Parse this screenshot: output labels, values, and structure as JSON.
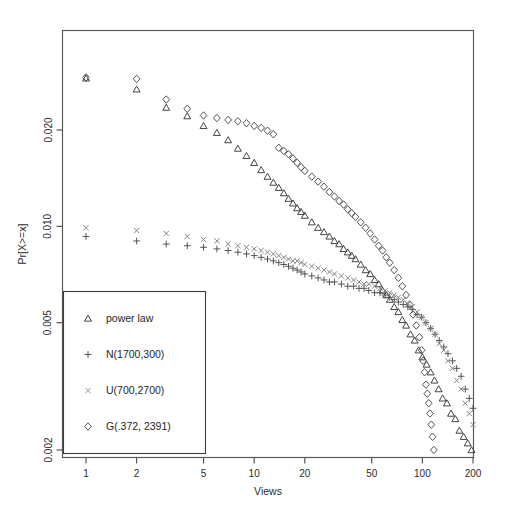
{
  "chart_data": {
    "type": "scatter",
    "title": "",
    "subtitle": "",
    "xlabel": "Views",
    "ylabel": "Pr[X>=x]",
    "xscale": "log",
    "yscale": "log",
    "xlim": [
      1,
      230
    ],
    "ylim": [
      0.0018,
      0.031
    ],
    "grid": false,
    "legend_position": "bottom-left",
    "xticks": [
      1,
      2,
      5,
      10,
      20,
      50,
      100,
      200
    ],
    "xtick_labels": [
      "1",
      "2",
      "5",
      "10",
      "20",
      "50",
      "100",
      "200"
    ],
    "yticks": [
      0.002,
      0.005,
      0.01,
      0.02
    ],
    "ytick_labels": [
      "0.002",
      "0.005",
      "0.010",
      "0.020"
    ],
    "series": [
      {
        "name": "power law",
        "marker": "triangle",
        "color": "#3a3a3a",
        "points": [
          [
            1,
            0.029
          ],
          [
            2,
            0.0268
          ],
          [
            3,
            0.0235
          ],
          [
            4,
            0.0221
          ],
          [
            5,
            0.0206
          ],
          [
            6,
            0.0196
          ],
          [
            7,
            0.0186
          ],
          [
            8,
            0.0175
          ],
          [
            9,
            0.0166
          ],
          [
            10,
            0.0158
          ],
          [
            11,
            0.015
          ],
          [
            12,
            0.0143
          ],
          [
            13,
            0.0137
          ],
          [
            14,
            0.0132
          ],
          [
            15,
            0.0127
          ],
          [
            16,
            0.0122
          ],
          [
            17,
            0.0118
          ],
          [
            18,
            0.0114
          ],
          [
            19,
            0.0111
          ],
          [
            20,
            0.0108
          ],
          [
            22,
            0.0103
          ],
          [
            24,
            0.0099
          ],
          [
            26,
            0.0096
          ],
          [
            28,
            0.0093
          ],
          [
            30,
            0.009
          ],
          [
            32,
            0.0088
          ],
          [
            34,
            0.0085
          ],
          [
            36,
            0.0083
          ],
          [
            38,
            0.0081
          ],
          [
            40,
            0.0079
          ],
          [
            43,
            0.0076
          ],
          [
            46,
            0.0073
          ],
          [
            49,
            0.0071
          ],
          [
            52,
            0.0068
          ],
          [
            55,
            0.0066
          ],
          [
            58,
            0.0063
          ],
          [
            61,
            0.0061
          ],
          [
            64,
            0.0059
          ],
          [
            68,
            0.0056
          ],
          [
            72,
            0.0054
          ],
          [
            76,
            0.0051
          ],
          [
            80,
            0.0049
          ],
          [
            85,
            0.0046
          ],
          [
            90,
            0.0044
          ],
          [
            95,
            0.0041
          ],
          [
            100,
            0.0039
          ],
          [
            106,
            0.0037
          ],
          [
            112,
            0.0035
          ],
          [
            118,
            0.0033
          ],
          [
            125,
            0.0031
          ],
          [
            132,
            0.0029
          ],
          [
            140,
            0.0028
          ],
          [
            148,
            0.0026
          ],
          [
            157,
            0.0025
          ],
          [
            166,
            0.0023
          ],
          [
            176,
            0.0022
          ],
          [
            186,
            0.0021
          ],
          [
            196,
            0.002
          ]
        ]
      },
      {
        "name": "N(1700,300)",
        "marker": "plus",
        "color": "#4c4c4c",
        "points": [
          [
            1,
            0.0093
          ],
          [
            2,
            0.009
          ],
          [
            3,
            0.0088
          ],
          [
            4,
            0.0087
          ],
          [
            5,
            0.0086
          ],
          [
            6,
            0.0085
          ],
          [
            7,
            0.0084
          ],
          [
            8,
            0.0083
          ],
          [
            9,
            0.0082
          ],
          [
            10,
            0.0081
          ],
          [
            11,
            0.008
          ],
          [
            12,
            0.0079
          ],
          [
            13,
            0.0078
          ],
          [
            14,
            0.0077
          ],
          [
            15,
            0.0076
          ],
          [
            16,
            0.0075
          ],
          [
            17,
            0.0074
          ],
          [
            18,
            0.0073
          ],
          [
            19,
            0.0072
          ],
          [
            20,
            0.0071
          ],
          [
            22,
            0.007
          ],
          [
            24,
            0.0069
          ],
          [
            26,
            0.0068
          ],
          [
            28,
            0.0067
          ],
          [
            30,
            0.0067
          ],
          [
            33,
            0.0066
          ],
          [
            36,
            0.0065
          ],
          [
            39,
            0.0065
          ],
          [
            42,
            0.0064
          ],
          [
            45,
            0.0064
          ],
          [
            48,
            0.0063
          ],
          [
            52,
            0.0062
          ],
          [
            56,
            0.0062
          ],
          [
            60,
            0.0061
          ],
          [
            64,
            0.006
          ],
          [
            68,
            0.0059
          ],
          [
            72,
            0.0058
          ],
          [
            77,
            0.0057
          ],
          [
            82,
            0.0056
          ],
          [
            87,
            0.0055
          ],
          [
            93,
            0.0053
          ],
          [
            99,
            0.0052
          ],
          [
            105,
            0.005
          ],
          [
            112,
            0.0048
          ],
          [
            119,
            0.0046
          ],
          [
            126,
            0.0044
          ],
          [
            134,
            0.0042
          ],
          [
            142,
            0.004
          ],
          [
            151,
            0.0038
          ],
          [
            160,
            0.0036
          ],
          [
            170,
            0.0034
          ],
          [
            180,
            0.0031
          ],
          [
            190,
            0.0029
          ],
          [
            200,
            0.0027
          ],
          [
            210,
            0.0025
          ],
          [
            218,
            0.0023
          ],
          [
            225,
            0.0021
          ]
        ]
      },
      {
        "name": "U(700,2700)",
        "marker": "cross",
        "color": "#7d7d7d",
        "points": [
          [
            1,
            0.0099
          ],
          [
            2,
            0.0097
          ],
          [
            3,
            0.0095
          ],
          [
            4,
            0.0093
          ],
          [
            5,
            0.0091
          ],
          [
            6,
            0.009
          ],
          [
            7,
            0.0088
          ],
          [
            8,
            0.0087
          ],
          [
            9,
            0.0086
          ],
          [
            10,
            0.0085
          ],
          [
            11,
            0.0084
          ],
          [
            12,
            0.0083
          ],
          [
            13,
            0.0082
          ],
          [
            14,
            0.0081
          ],
          [
            15,
            0.008
          ],
          [
            16,
            0.0079
          ],
          [
            17,
            0.0078
          ],
          [
            18,
            0.0078
          ],
          [
            19,
            0.0077
          ],
          [
            20,
            0.0076
          ],
          [
            22,
            0.0075
          ],
          [
            24,
            0.0074
          ],
          [
            26,
            0.0073
          ],
          [
            28,
            0.0072
          ],
          [
            30,
            0.0071
          ],
          [
            33,
            0.007
          ],
          [
            36,
            0.0069
          ],
          [
            39,
            0.0068
          ],
          [
            42,
            0.0067
          ],
          [
            45,
            0.0066
          ],
          [
            48,
            0.0066
          ],
          [
            52,
            0.0065
          ],
          [
            56,
            0.0064
          ],
          [
            60,
            0.0063
          ],
          [
            64,
            0.0062
          ],
          [
            68,
            0.0061
          ],
          [
            72,
            0.006
          ],
          [
            77,
            0.0059
          ],
          [
            82,
            0.0057
          ],
          [
            87,
            0.0056
          ],
          [
            93,
            0.0054
          ],
          [
            99,
            0.0052
          ],
          [
            105,
            0.005
          ],
          [
            112,
            0.0048
          ],
          [
            119,
            0.0046
          ],
          [
            126,
            0.0043
          ],
          [
            134,
            0.0041
          ],
          [
            142,
            0.0038
          ],
          [
            151,
            0.0036
          ],
          [
            160,
            0.0033
          ],
          [
            170,
            0.0031
          ],
          [
            180,
            0.0028
          ],
          [
            190,
            0.0026
          ],
          [
            200,
            0.0024
          ],
          [
            208,
            0.0022
          ],
          [
            214,
            0.002
          ]
        ]
      },
      {
        "name": "G(.372, 2391)",
        "marker": "diamond",
        "color": "#4a4a4a",
        "points": [
          [
            1,
            0.0292
          ],
          [
            2,
            0.0289
          ],
          [
            3,
            0.0249
          ],
          [
            4,
            0.0233
          ],
          [
            5,
            0.0222
          ],
          [
            6,
            0.0218
          ],
          [
            7,
            0.0215
          ],
          [
            8,
            0.0213
          ],
          [
            9,
            0.021
          ],
          [
            10,
            0.0206
          ],
          [
            11,
            0.0203
          ],
          [
            12,
            0.0199
          ],
          [
            13,
            0.0194
          ],
          [
            14,
            0.0176
          ],
          [
            15,
            0.0172
          ],
          [
            16,
            0.0168
          ],
          [
            17,
            0.0163
          ],
          [
            18,
            0.0158
          ],
          [
            19,
            0.0153
          ],
          [
            20,
            0.0149
          ],
          [
            22,
            0.0143
          ],
          [
            24,
            0.0138
          ],
          [
            26,
            0.0133
          ],
          [
            28,
            0.0128
          ],
          [
            30,
            0.0124
          ],
          [
            32,
            0.012
          ],
          [
            34,
            0.0117
          ],
          [
            36,
            0.0113
          ],
          [
            38,
            0.011
          ],
          [
            40,
            0.0107
          ],
          [
            43,
            0.0103
          ],
          [
            46,
            0.0099
          ],
          [
            49,
            0.0095
          ],
          [
            52,
            0.0091
          ],
          [
            55,
            0.0087
          ],
          [
            58,
            0.0084
          ],
          [
            61,
            0.008
          ],
          [
            64,
            0.0077
          ],
          [
            68,
            0.0073
          ],
          [
            72,
            0.0069
          ],
          [
            76,
            0.0065
          ],
          [
            80,
            0.0061
          ],
          [
            84,
            0.0057
          ],
          [
            88,
            0.0053
          ],
          [
            92,
            0.0049
          ],
          [
            96,
            0.0045
          ],
          [
            99,
            0.0041
          ],
          [
            101,
            0.0038
          ],
          [
            103,
            0.0035
          ],
          [
            105,
            0.0032
          ],
          [
            107,
            0.003
          ],
          [
            109,
            0.0028
          ],
          [
            111,
            0.0026
          ],
          [
            113,
            0.0024
          ],
          [
            115,
            0.0022
          ],
          [
            117,
            0.002
          ]
        ]
      }
    ]
  },
  "axes": {
    "x_title": "Views",
    "y_title": "Pr[X>=x]"
  },
  "legend": {
    "entries": [
      {
        "marker": "triangle",
        "label": "power law"
      },
      {
        "marker": "plus",
        "label": "N(1700,300)"
      },
      {
        "marker": "cross",
        "label": "U(700,2700)"
      },
      {
        "marker": "diamond",
        "label": "G(.372, 2391)"
      }
    ]
  },
  "colors": {
    "axis": "#4a4a4a",
    "frame": "#5a5a5a",
    "text": "#2b2b2b",
    "background": "#ffffff"
  }
}
